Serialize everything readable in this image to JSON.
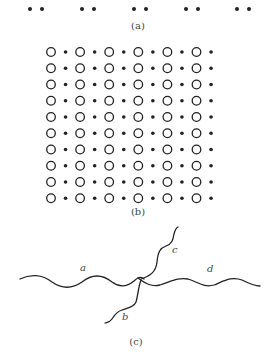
{
  "figure": {
    "panels": [
      {
        "id": "a",
        "label": "(a)",
        "description": "1D chain of atom pairs",
        "pair_centers_x": [
          36,
          88,
          140,
          192,
          243
        ],
        "pair_separation": 12,
        "y": 9
      },
      {
        "id": "b",
        "label": "(b)",
        "description": "2D lattice of alternating open circles and filled dots",
        "rows": 10,
        "circles_per_row": 6,
        "dots_per_row": 6
      },
      {
        "id": "c",
        "label": "(c)",
        "description": "Four wavy lines meeting at a junction",
        "curve_labels": [
          "a",
          "b",
          "c",
          "d"
        ]
      }
    ],
    "caption_partial": "Figure 1.7 ... (cut off)"
  },
  "colors": {
    "ink": "#222222",
    "label": "#444444",
    "background": "#ffffff"
  }
}
